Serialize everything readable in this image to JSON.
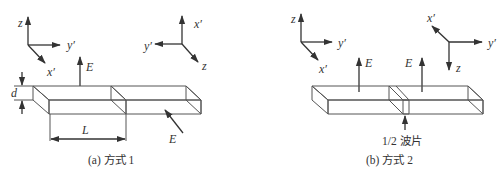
{
  "figure_a": {
    "caption": "(a)  方式 1",
    "axes_left": {
      "z": "z",
      "y": "y′",
      "x": "x′"
    },
    "axes_right": {
      "x": "x′",
      "y": "y′",
      "z": "z"
    },
    "e_top": "E",
    "e_side": "E",
    "thickness": "d",
    "length": "L"
  },
  "figure_b": {
    "caption": "(b)  方式 2",
    "axes_left": {
      "z": "z",
      "y": "y′",
      "x": "x′"
    },
    "axes_right": {
      "x": "x′",
      "y": "y′",
      "z": "z"
    },
    "e_left": "E",
    "e_right": "E",
    "waveplate": "1/2 波片"
  },
  "colors": {
    "line": "#555555",
    "text": "#333333",
    "dots": "#777777"
  }
}
